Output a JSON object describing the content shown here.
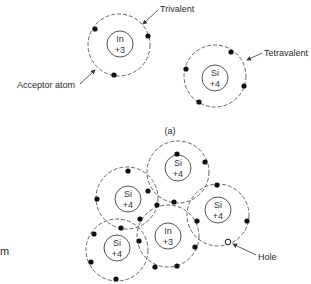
{
  "diagram": {
    "part_a": {
      "caption": "(a)",
      "labels": {
        "trivalent": "Trivalent",
        "tetravalent": "Tetravalent",
        "acceptor": "Acceptor atom"
      },
      "atoms": [
        {
          "symbol": "In",
          "charge": "+3",
          "valence_electrons": 3
        },
        {
          "symbol": "Si",
          "charge": "+4",
          "valence_electrons": 4
        }
      ]
    },
    "part_b": {
      "labels": {
        "hole": "Hole"
      },
      "atoms": [
        {
          "symbol": "Si",
          "charge": "+4"
        },
        {
          "symbol": "Si",
          "charge": "+4"
        },
        {
          "symbol": "Si",
          "charge": "+4"
        },
        {
          "symbol": "In",
          "charge": "+3"
        },
        {
          "symbol": "Si",
          "charge": "+4"
        }
      ],
      "edge_fragment": "m"
    }
  }
}
